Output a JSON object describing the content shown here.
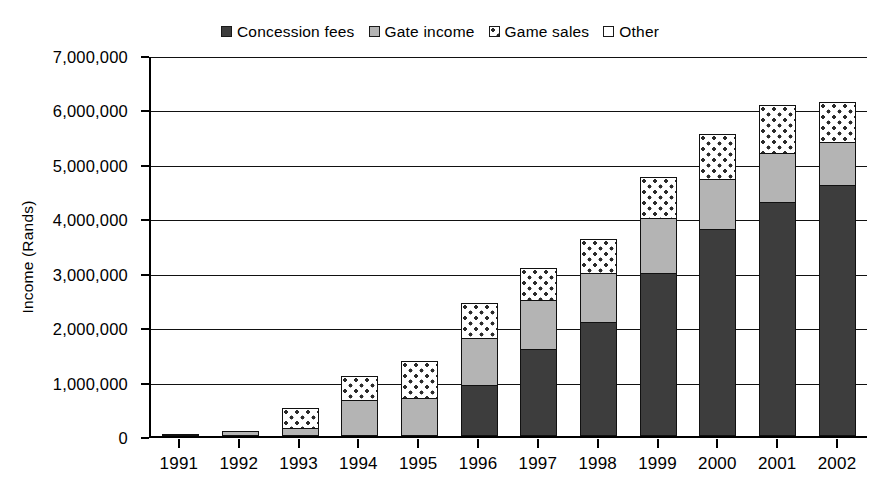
{
  "chart_data": {
    "type": "bar",
    "subtype": "stacked-bar",
    "title": "",
    "xlabel": "",
    "ylabel": "Income (Rands)",
    "ylim": [
      0,
      7000000
    ],
    "ytick_values": [
      0,
      1000000,
      2000000,
      3000000,
      4000000,
      5000000,
      6000000,
      7000000
    ],
    "ytick_labels": [
      "0",
      "1,000,000",
      "2,000,000",
      "3,000,000",
      "4,000,000",
      "5,000,000",
      "6,000,000",
      "7,000,000"
    ],
    "grid": true,
    "grid_axis": "y",
    "legend_position": "top-center",
    "categories": [
      "1991",
      "1992",
      "1993",
      "1994",
      "1995",
      "1996",
      "1997",
      "1998",
      "1999",
      "2000",
      "2001",
      "2002"
    ],
    "series": [
      {
        "name": "Concession fees",
        "color": "#3d3d3d",
        "pattern": "solid-dark",
        "values": [
          0,
          0,
          0,
          0,
          0,
          940000,
          1600000,
          2100000,
          3000000,
          3800000,
          4300000,
          4620000
        ]
      },
      {
        "name": "Gate income",
        "color": "#b4b4b4",
        "pattern": "solid-gray",
        "values": [
          25000,
          85000,
          150000,
          660000,
          700000,
          860000,
          900000,
          900000,
          1000000,
          920000,
          900000,
          780000
        ]
      },
      {
        "name": "Game sales",
        "color": "#ffffff",
        "pattern": "dotted",
        "values": [
          0,
          0,
          370000,
          440000,
          680000,
          650000,
          580000,
          620000,
          760000,
          830000,
          880000,
          730000
        ]
      },
      {
        "name": "Other",
        "color": "#ffffff",
        "pattern": "open",
        "values": [
          0,
          0,
          0,
          0,
          0,
          0,
          0,
          0,
          0,
          0,
          0,
          0
        ]
      }
    ],
    "totals": [
      25000,
      85000,
      520000,
      1100000,
      1380000,
      2450000,
      3080000,
      3620000,
      4760000,
      5550000,
      6080000,
      6130000
    ]
  },
  "legend": {
    "items": [
      {
        "label": "Concession fees",
        "swatch": "legend-swatch-concession-fees"
      },
      {
        "label": "Gate income",
        "swatch": "legend-swatch-gate-income"
      },
      {
        "label": "Game sales",
        "swatch": "legend-swatch-game-sales"
      },
      {
        "label": "Other",
        "swatch": "legend-swatch-other"
      }
    ]
  },
  "colors": {
    "concession_fees": "#3d3d3d",
    "gate_income": "#b4b4b4",
    "game_sales": "#ffffff",
    "other": "#ffffff",
    "axis": "#000000",
    "gridline": "#111111",
    "background": "#ffffff"
  }
}
